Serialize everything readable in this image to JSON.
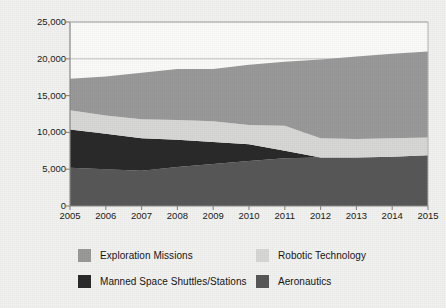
{
  "axis_title": "In millions of dollars",
  "colors": {
    "background": "#f2f2f0",
    "plot_background": "#fbfbfa",
    "axis": "#8a8a8a",
    "grid": "#b4b4b4",
    "exploration": "#9a9a9a",
    "robotic": "#d8d8d6",
    "manned": "#2a2a2a",
    "aeronautics": "#585858",
    "text": "#161616"
  },
  "legend": {
    "items": [
      {
        "label": "Exploration Missions",
        "color_key": "exploration",
        "swatch": "#9a9a9a"
      },
      {
        "label": "Robotic Technology",
        "color_key": "robotic",
        "swatch": "#d8d8d6"
      },
      {
        "label": "Manned Space Shuttles/Stations",
        "color_key": "manned",
        "swatch": "#2a2a2a"
      },
      {
        "label": "Aeronautics",
        "color_key": "aeronautics",
        "swatch": "#585858"
      }
    ]
  },
  "chart_data": {
    "type": "area",
    "stacked": true,
    "title": "",
    "xlabel": "",
    "ylabel": "In millions of dollars",
    "xlim": [
      2005,
      2015
    ],
    "ylim": [
      0,
      25000
    ],
    "yticks": [
      0,
      5000,
      10000,
      15000,
      20000,
      25000
    ],
    "ytick_labels": [
      "0",
      "5,000",
      "10,000",
      "15,000",
      "20,000",
      "25,000"
    ],
    "grid": true,
    "legend_position": "bottom",
    "categories": [
      2005,
      2006,
      2007,
      2008,
      2009,
      2010,
      2011,
      2012,
      2013,
      2014,
      2015
    ],
    "xtick_labels": [
      "2005",
      "2006",
      "2007",
      "2008",
      "2009",
      "2010",
      "2011",
      "2012",
      "2013",
      "2014",
      "2015"
    ],
    "series": [
      {
        "name": "Aeronautics",
        "color": "#585858",
        "values": [
          5200,
          5000,
          4800,
          5300,
          5700,
          6100,
          6500,
          6600,
          6600,
          6700,
          6900
        ]
      },
      {
        "name": "Manned Space Shuttles/Stations",
        "color": "#2a2a2a",
        "values": [
          5200,
          4800,
          4400,
          3700,
          3000,
          2300,
          1000,
          0,
          0,
          0,
          0
        ]
      },
      {
        "name": "Robotic Technology",
        "color": "#d8d8d6",
        "values": [
          2600,
          2500,
          2600,
          2700,
          2800,
          2600,
          3400,
          2600,
          2500,
          2500,
          2400
        ]
      },
      {
        "name": "Exploration Missions",
        "color": "#9a9a9a",
        "values": [
          4300,
          5300,
          6300,
          6900,
          7100,
          8200,
          8700,
          10700,
          11200,
          11500,
          11700
        ]
      }
    ],
    "cumulative_totals": [
      17300,
      17600,
      18100,
      18600,
      18600,
      19200,
      19600,
      19900,
      20300,
      20700,
      21000
    ]
  }
}
